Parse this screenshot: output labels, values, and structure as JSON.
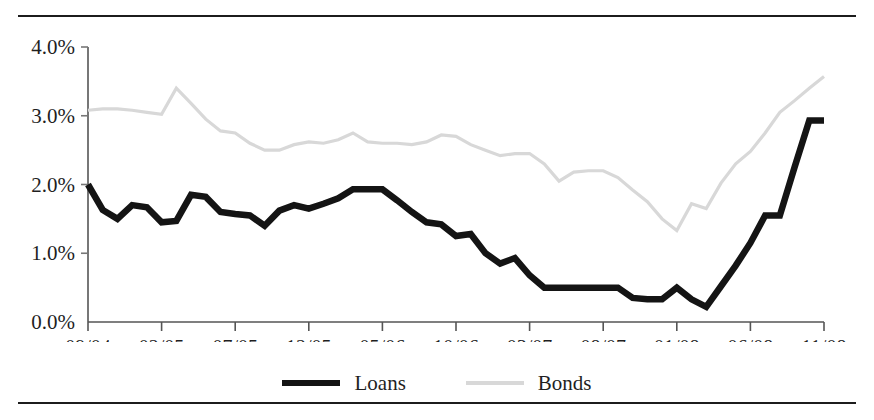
{
  "chart_data": {
    "type": "line",
    "title": "",
    "subtitle": "",
    "xlabel": "",
    "ylabel": "",
    "ylim": [
      0.0,
      4.0
    ],
    "y_ticks": [
      "0.0%",
      "1.0%",
      "2.0%",
      "3.0%",
      "4.0%"
    ],
    "y_tick_values": [
      0.0,
      1.0,
      2.0,
      3.0,
      4.0
    ],
    "x_ticks": [
      "09/04",
      "02/05",
      "07/05",
      "12/05",
      "05/06",
      "10/06",
      "03/07",
      "08/07",
      "01/08",
      "06/08",
      "11/08"
    ],
    "x_tick_values": [
      0,
      5,
      10,
      15,
      20,
      25,
      30,
      35,
      40,
      45,
      50
    ],
    "x_unit": "month",
    "grid": false,
    "legend_position": "bottom-center",
    "categories": [
      "09/04",
      "10/04",
      "11/04",
      "12/04",
      "01/05",
      "02/05",
      "03/05",
      "04/05",
      "05/05",
      "06/05",
      "07/05",
      "08/05",
      "09/05",
      "10/05",
      "11/05",
      "12/05",
      "01/06",
      "02/06",
      "03/06",
      "04/06",
      "05/06",
      "06/06",
      "07/06",
      "08/06",
      "09/06",
      "10/06",
      "11/06",
      "12/06",
      "01/07",
      "02/07",
      "03/07",
      "04/07",
      "05/07",
      "06/07",
      "07/07",
      "08/07",
      "09/07",
      "10/07",
      "11/07",
      "12/07",
      "01/08",
      "02/08",
      "03/08",
      "04/08",
      "05/08",
      "06/08",
      "07/08",
      "08/08",
      "09/08",
      "10/08",
      "11/08"
    ],
    "series": [
      {
        "name": "Loans",
        "color": "#141414",
        "values": [
          2.0,
          1.63,
          1.5,
          1.7,
          1.67,
          1.45,
          1.47,
          1.85,
          1.82,
          1.6,
          1.57,
          1.55,
          1.4,
          1.62,
          1.7,
          1.65,
          1.72,
          1.8,
          1.93,
          1.93,
          1.93,
          1.77,
          1.6,
          1.45,
          1.42,
          1.25,
          1.28,
          1.0,
          0.85,
          0.93,
          0.68,
          0.5,
          0.5,
          0.5,
          0.5,
          0.5,
          0.5,
          0.35,
          0.33,
          0.33,
          0.5,
          0.33,
          0.22,
          0.52,
          0.82,
          1.15,
          1.55,
          1.55,
          2.25,
          2.93,
          2.93
        ]
      },
      {
        "name": "Bonds",
        "color": "#d8d8d8",
        "values": [
          3.08,
          3.1,
          3.1,
          3.08,
          3.05,
          3.02,
          3.4,
          3.18,
          2.95,
          2.78,
          2.75,
          2.6,
          2.5,
          2.5,
          2.58,
          2.62,
          2.6,
          2.65,
          2.75,
          2.62,
          2.6,
          2.6,
          2.58,
          2.62,
          2.72,
          2.7,
          2.58,
          2.5,
          2.42,
          2.45,
          2.45,
          2.3,
          2.05,
          2.18,
          2.2,
          2.2,
          2.1,
          1.92,
          1.75,
          1.5,
          1.33,
          1.72,
          1.65,
          2.02,
          2.3,
          2.48,
          2.75,
          3.05,
          3.22,
          3.4,
          3.57
        ]
      }
    ]
  },
  "legend": {
    "items": [
      {
        "label": "Loans",
        "color": "#141414"
      },
      {
        "label": "Bonds",
        "color": "#d8d8d8"
      }
    ]
  }
}
